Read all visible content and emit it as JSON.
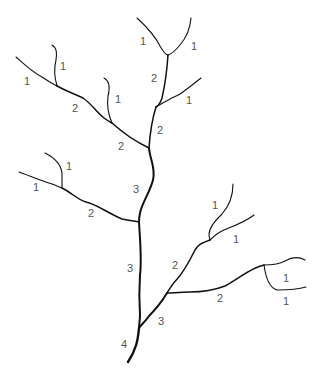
{
  "colors": {
    "stream": "#111111",
    "label": "#555555",
    "background": "#ffffff"
  },
  "labels": [
    {
      "id": "top-left-1a",
      "text": "1",
      "x": 140,
      "y": 45
    },
    {
      "id": "top-right-1",
      "text": "1",
      "x": 191,
      "y": 50
    },
    {
      "id": "upper-2a",
      "text": "2",
      "x": 151,
      "y": 82
    },
    {
      "id": "upper-right-1",
      "text": "1",
      "x": 186,
      "y": 104
    },
    {
      "id": "upper-2b",
      "text": "2",
      "x": 157,
      "y": 134
    },
    {
      "id": "left-1a",
      "text": "1",
      "x": 24,
      "y": 85
    },
    {
      "id": "left-1b",
      "text": "1",
      "x": 60,
      "y": 70
    },
    {
      "id": "left-2a",
      "text": "2",
      "x": 72,
      "y": 112
    },
    {
      "id": "left-1c",
      "text": "1",
      "x": 115,
      "y": 103
    },
    {
      "id": "left-2b",
      "text": "2",
      "x": 118,
      "y": 150
    },
    {
      "id": "middle-3",
      "text": "3",
      "x": 133,
      "y": 193
    },
    {
      "id": "mid-left-1a",
      "text": "1",
      "x": 66,
      "y": 170
    },
    {
      "id": "mid-left-1b",
      "text": "1",
      "x": 33,
      "y": 191
    },
    {
      "id": "mid-left-2",
      "text": "2",
      "x": 88,
      "y": 217
    },
    {
      "id": "lower-3",
      "text": "3",
      "x": 127,
      "y": 272
    },
    {
      "id": "right-1a",
      "text": "1",
      "x": 212,
      "y": 209
    },
    {
      "id": "right-1b",
      "text": "1",
      "x": 233,
      "y": 243
    },
    {
      "id": "right-2a",
      "text": "2",
      "x": 172,
      "y": 269
    },
    {
      "id": "far-right-1a",
      "text": "1",
      "x": 283,
      "y": 282
    },
    {
      "id": "far-right-1b",
      "text": "1",
      "x": 283,
      "y": 305
    },
    {
      "id": "right-2b",
      "text": "2",
      "x": 217,
      "y": 302
    },
    {
      "id": "confluence-3",
      "text": "3",
      "x": 158,
      "y": 325
    },
    {
      "id": "outlet-4",
      "text": "4",
      "x": 121,
      "y": 348
    }
  ]
}
